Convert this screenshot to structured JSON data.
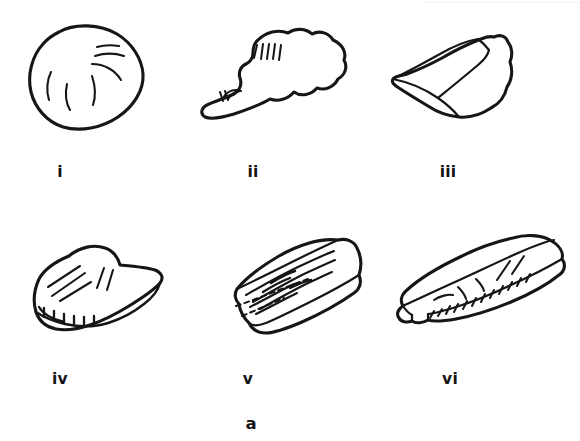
{
  "figure": {
    "panel_label": "a",
    "background_color": "#ffffff",
    "ink_color": "#161616",
    "kind": "line-drawing-plate",
    "columns": 3,
    "rows": 2,
    "items": [
      {
        "label": "i",
        "name": "artefact-i",
        "description": "rounded oval pebble with four short interior curved lines near the upper right",
        "caption_x": 60,
        "caption_y": 163
      },
      {
        "label": "ii",
        "name": "artefact-ii",
        "description": "irregular lobed flake with a vertical tally of five short strokes and a small arc group at lower left",
        "caption_x": 253,
        "caption_y": 163
      },
      {
        "label": "iii",
        "name": "artefact-iii",
        "description": "angular faceted core with a ridge running to a pointed left tip",
        "caption_x": 448,
        "caption_y": 163
      },
      {
        "label": "iv",
        "name": "artefact-iv",
        "description": "domed scraper with fan of five incision lines and a denticulate retouched lower edge",
        "caption_x": 60,
        "caption_y": 370
      },
      {
        "label": "v",
        "name": "artefact-v",
        "description": "elongated prismatic blade in oblique view with long parallel flake scars and dashed ridge lines",
        "caption_x": 248,
        "caption_y": 370
      },
      {
        "label": "vi",
        "name": "artefact-vi",
        "description": "long rectangular bar tool with short dorsal strokes and a hatched lateral retouch band",
        "caption_x": 450,
        "caption_y": 370
      }
    ]
  }
}
